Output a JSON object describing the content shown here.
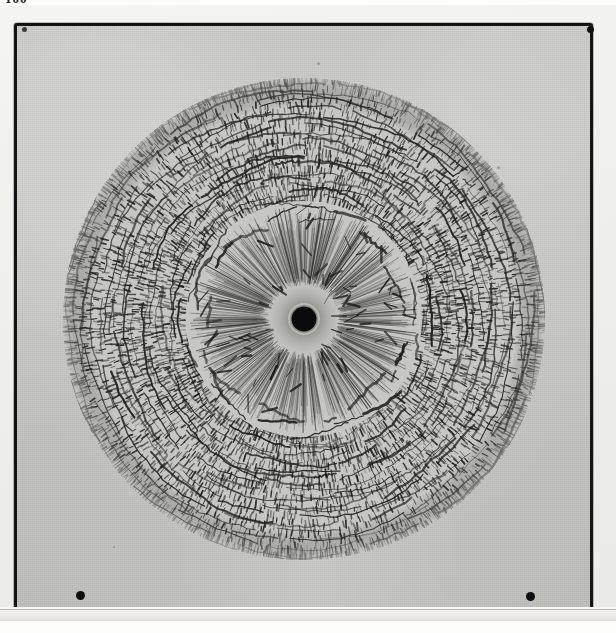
{
  "document": {
    "folio": "100",
    "kind": "photographic-plate",
    "caption": ""
  },
  "mount": {
    "background_color": "#eeeeea",
    "frame_color": "#141414",
    "plate_color": "#c8c8c4"
  },
  "marks": {
    "dot_bottom_left": "registration-dot",
    "dot_bottom_right": "registration-dot",
    "dot_top_right": "registration-dot",
    "dot_top_left": "registration-dot"
  },
  "chart_data": {
    "type": "scatter",
    "title": "",
    "subtitle": "",
    "xlabel": "",
    "ylabel": "",
    "center": [
      304,
      309
    ],
    "outer_radius": 241,
    "zones": [
      {
        "name": "central-hole",
        "r_inner": 0,
        "r_outer": 12,
        "texture": "solid-black"
      },
      {
        "name": "halo",
        "r_inner": 12,
        "r_outer": 34,
        "texture": "soft-grey-diffuse"
      },
      {
        "name": "inner-ray-zone",
        "r_inner": 34,
        "r_outer": 108,
        "texture": "fine-radial-rays"
      },
      {
        "name": "inner-crack-ring",
        "r_inner": 100,
        "r_outer": 118,
        "texture": "broken-arc-ring"
      },
      {
        "name": "outer-cell-zone",
        "r_inner": 118,
        "r_outer": 241,
        "texture": "dense-cellular-bricks"
      }
    ],
    "ray_count": 360,
    "ring_count": 22,
    "ink_color": "#1b1b1b",
    "paper_color": "#c8c8c4",
    "grid": false,
    "legend": "none"
  }
}
